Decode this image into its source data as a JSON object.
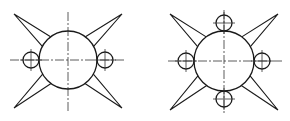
{
  "diagram": {
    "figures": [
      {
        "id": "left",
        "main_circle": {
          "cx": 68,
          "cy": 60,
          "r": 29
        },
        "small_circles": [
          {
            "cx": 31,
            "cy": 60,
            "r": 8
          },
          {
            "cx": 105,
            "cy": 60,
            "r": 8
          }
        ],
        "spike_tips": [
          [
            14,
            14
          ],
          [
            122,
            14
          ],
          [
            14,
            108
          ],
          [
            122,
            108
          ]
        ],
        "axis_h": {
          "x1": 10,
          "x2": 126,
          "y": 60
        },
        "axis_v": {
          "x": 68,
          "y1": 12,
          "y2": 113
        }
      },
      {
        "id": "right",
        "main_circle": {
          "cx": 224,
          "cy": 61,
          "r": 30
        },
        "small_circles": [
          {
            "cx": 224,
            "cy": 23,
            "r": 8
          },
          {
            "cx": 224,
            "cy": 99,
            "r": 8
          },
          {
            "cx": 186,
            "cy": 61,
            "r": 8
          },
          {
            "cx": 262,
            "cy": 61,
            "r": 8
          }
        ],
        "spike_tips": [
          [
            170,
            14
          ],
          [
            278,
            14
          ],
          [
            170,
            110
          ],
          [
            278,
            110
          ]
        ],
        "axis_h": {
          "x1": 168,
          "x2": 282,
          "y": 61
        },
        "axis_v": {
          "x": 224,
          "y1": 10,
          "y2": 114
        }
      }
    ],
    "colors": {
      "stroke": "#1a1a1a",
      "background": "#ffffff"
    }
  }
}
